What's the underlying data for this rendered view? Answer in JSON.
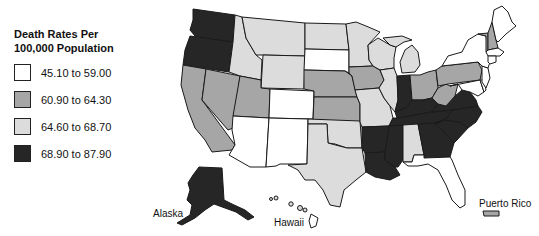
{
  "legend": {
    "title_line1": "Death Rates Per",
    "title_line2": "100,000 Population",
    "items": [
      {
        "label": "45.10 to 59.00",
        "color": "#ffffff"
      },
      {
        "label": "60.90 to 64.30",
        "color": "#a6a6a6"
      },
      {
        "label": "64.60 to 68.70",
        "color": "#dcdcdc"
      },
      {
        "label": "68.90 to 87.90",
        "color": "#262626"
      }
    ]
  },
  "labels": {
    "alaska": "Alaska",
    "hawaii": "Hawaii",
    "puerto_rico": "Puerto Rico"
  },
  "states": {
    "WA": 3,
    "OR": 3,
    "CA": 1,
    "NV": 1,
    "ID": 2,
    "MT": 2,
    "WY": 2,
    "UT": 1,
    "AZ": 0,
    "NM": 0,
    "CO": 0,
    "ND": 2,
    "SD": 0,
    "NE": 1,
    "KS": 1,
    "OK": 2,
    "TX": 2,
    "MN": 2,
    "IA": 1,
    "MO": 2,
    "AR": 3,
    "LA": 3,
    "WI": 2,
    "IL": 2,
    "MI": 2,
    "IN": 3,
    "OH": 1,
    "KY": 3,
    "TN": 3,
    "MS": 3,
    "AL": 2,
    "GA": 3,
    "FL": 0,
    "SC": 3,
    "NC": 3,
    "VA": 3,
    "WV": 1,
    "PA": 1,
    "NY": 0,
    "VT": 1,
    "NH": 1,
    "ME": 0,
    "MA": 0,
    "CT": 0,
    "NJ": 0,
    "MD": 0,
    "DE": 0,
    "AK": 3,
    "HI": 2,
    "PR": 1
  }
}
